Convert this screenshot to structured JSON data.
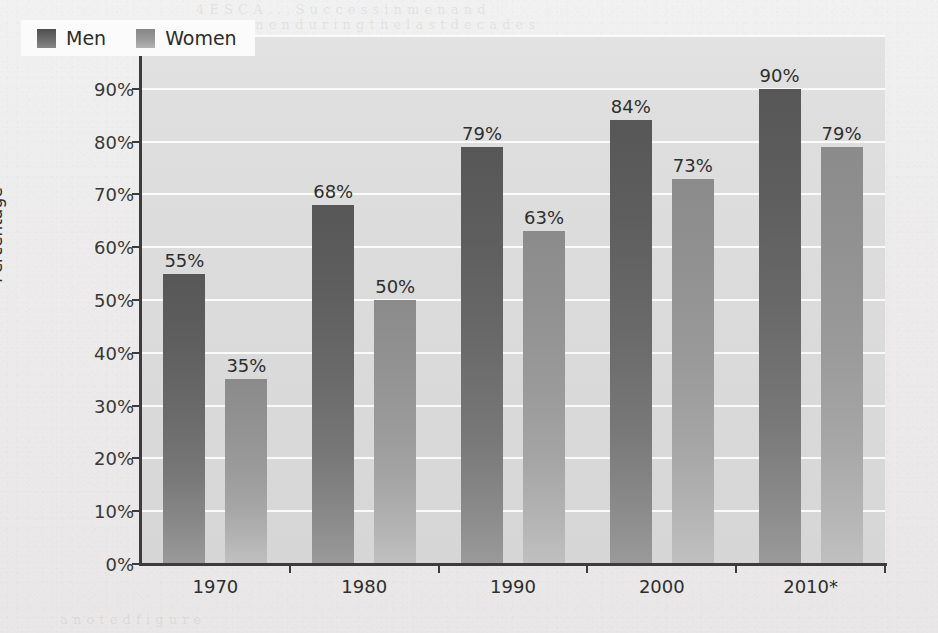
{
  "chart_data": {
    "type": "bar",
    "title": "",
    "subtitle": "",
    "xlabel": "",
    "ylabel": "Percentage",
    "categories": [
      "1970",
      "1980",
      "1990",
      "2000",
      "2010*"
    ],
    "series": [
      {
        "name": "Men",
        "color": "#6a6a6a",
        "values": [
          55,
          68,
          79,
          84,
          90
        ],
        "labels": [
          "55%",
          "68%",
          "79%",
          "84%",
          "90%"
        ]
      },
      {
        "name": "Women",
        "color": "#9a9a9a",
        "values": [
          35,
          50,
          63,
          73,
          79
        ],
        "labels": [
          "35%",
          "50%",
          "63%",
          "73%",
          "79%"
        ]
      }
    ],
    "ylim": [
      0,
      100
    ],
    "ytick_values": [
      0,
      10,
      20,
      30,
      40,
      50,
      60,
      70,
      80,
      90,
      100
    ],
    "ytick_labels": [
      "0%",
      "10%",
      "20%",
      "30%",
      "40%",
      "50%",
      "60%",
      "70%",
      "80%",
      "90%",
      "100%"
    ],
    "grid": "horizontal",
    "legend_position": "top-left",
    "value_labels": true
  },
  "legend": {
    "entries": [
      {
        "label": "Men",
        "swatch": "men-legend-swatch"
      },
      {
        "label": "Women",
        "swatch": "women-legend-swatch"
      }
    ]
  },
  "axes": {
    "y_title": "Percentage"
  },
  "background_bleed": {
    "lines": [
      "4  E  S  C  A  .  .  .  S  u  c  c  e  s  s   i  n   m  e  n   a  n  d",
      "w  o  m  e  n   d  u  r  i  n  g   t  h  e   l  a  s  t   d  e  c  a  d  e  s",
      "E  d  u  c  a  t  i  o  n   a  t  t  a  i  n  m  e  n  t",
      "t  h  e   p  r  o  p  o  r  t  i  o  n   o  f   t  h  e",
      "p  o  p  u  l  a  t  i  o  n   a  g  e  d   2  5   t  o",
      "3  4   w  i  t  h   a   d  e  g  r  e  e",
      "a   n   o   t   e   d       f   i   g   u   r   e"
    ]
  }
}
